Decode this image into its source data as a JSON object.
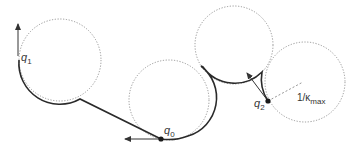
{
  "diagram": {
    "colors": {
      "path": "#2a2a2a",
      "circle": "#8a8a8a",
      "arrow": "#333333",
      "background": "#ffffff"
    },
    "circles": [
      {
        "id": "c1",
        "cx": 60,
        "cy": 60,
        "r": 41
      },
      {
        "id": "c2",
        "cx": 169,
        "cy": 100,
        "r": 40
      },
      {
        "id": "c3",
        "cx": 234,
        "cy": 45,
        "r": 39
      },
      {
        "id": "c4",
        "cx": 305,
        "cy": 82,
        "r": 40
      }
    ],
    "configurations": [
      {
        "id": "q0",
        "label": "q",
        "subscript": "0",
        "x": 161,
        "y": 139
      },
      {
        "id": "q1",
        "label": "q",
        "subscript": "1",
        "x": 18,
        "y": 55
      },
      {
        "id": "q2",
        "label": "q",
        "subscript": "2",
        "x": 268,
        "y": 101
      }
    ],
    "radius_label": {
      "prefix": "1/κ",
      "subscript": "max"
    }
  }
}
